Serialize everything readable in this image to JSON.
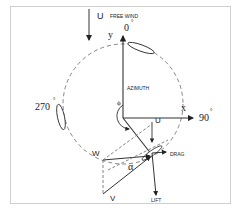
{
  "diagram": {
    "labels": {
      "free_wind_symbol": "U",
      "free_wind": "FREE WIND",
      "y_axis": "y",
      "x_axis": "x",
      "angle_0": "0",
      "angle_90": "90",
      "angle_270": "270",
      "degree": "°",
      "azimuth": "AZIMUTH",
      "phi": "ϕ",
      "u_local": "U",
      "drag": "DRAG",
      "lift": "LIFT",
      "relative_wind": "W",
      "blade_velocity": "V",
      "alpha": "α"
    },
    "colors": {
      "line": "#333333",
      "dashed": "#777777",
      "frame": "#cccccc",
      "text": "#222222"
    }
  }
}
